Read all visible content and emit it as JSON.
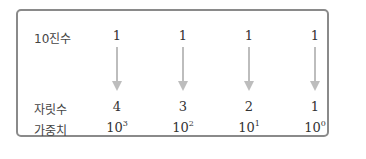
{
  "rows": {
    "decimal": {
      "label": "10진수",
      "values": [
        "1",
        "1",
        "1",
        "1"
      ]
    },
    "position": {
      "label": "자릿수",
      "values": [
        "4",
        "3",
        "2",
        "1"
      ]
    },
    "weight": {
      "label": "가중치",
      "base": "10",
      "exponents": [
        "3",
        "2",
        "1",
        "0"
      ]
    }
  },
  "colors": {
    "border": "#8a8a8a",
    "arrow": "#bdbdbd",
    "text": "#333333"
  }
}
